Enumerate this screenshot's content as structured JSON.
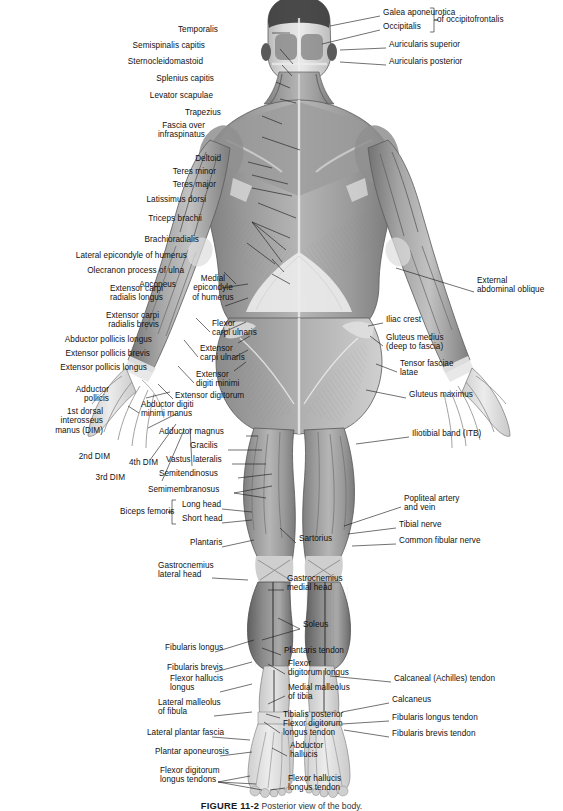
{
  "figure": {
    "caption_number": "FIGURE 11-2",
    "caption_text": "Posterior view of the body.",
    "view": "posterior",
    "background_color": "#ffffff",
    "ink_color": "#1a1a1a"
  },
  "labels_left": [
    {
      "id": "temporalis",
      "text": "Temporalis",
      "x": 218,
      "y": 30,
      "lines": 1
    },
    {
      "id": "semispinalis-capitis",
      "text": "Semispinalis capitis",
      "x": 205,
      "y": 46,
      "lines": 1
    },
    {
      "id": "sternocleidomastoid",
      "text": "Sternocleidomastoid",
      "x": 203,
      "y": 62,
      "lines": 1
    },
    {
      "id": "splenius-capitis",
      "text": "Splenius capitis",
      "x": 214,
      "y": 79,
      "lines": 1
    },
    {
      "id": "levator-scapulae",
      "text": "Levator scapulae",
      "x": 213,
      "y": 96,
      "lines": 1
    },
    {
      "id": "trapezius",
      "text": "Trapezius",
      "x": 221,
      "y": 113,
      "lines": 1
    },
    {
      "id": "fascia-over-infraspinatus",
      "text": "Fascia over\ninfraspinatus",
      "x": 205,
      "y": 130,
      "lines": 2
    },
    {
      "id": "deltoid",
      "text": "Deltoid",
      "x": 221,
      "y": 159,
      "lines": 1
    },
    {
      "id": "teres-minor",
      "text": "Teres minor",
      "x": 216,
      "y": 172,
      "lines": 1
    },
    {
      "id": "teres-major",
      "text": "Teres major",
      "x": 216,
      "y": 185,
      "lines": 1
    },
    {
      "id": "latissimus-dorsi",
      "text": "Latissimus dorsi",
      "x": 206,
      "y": 200,
      "lines": 1
    },
    {
      "id": "triceps-brachii",
      "text": "Triceps brachii",
      "x": 202,
      "y": 219,
      "lines": 1
    },
    {
      "id": "brachioradialis",
      "text": "Brachioradialis",
      "x": 199,
      "y": 240,
      "lines": 1
    },
    {
      "id": "lateral-epicondyle-humerus",
      "text": "Lateral epicondyle of humerus",
      "x": 187,
      "y": 256,
      "lines": 1
    },
    {
      "id": "olecranon-process-ulna",
      "text": "Olecranon process of ulna",
      "x": 184,
      "y": 271,
      "lines": 1
    },
    {
      "id": "anconeus",
      "text": "Anconeus",
      "x": 176,
      "y": 285,
      "lines": 1
    },
    {
      "id": "extensor-carpi-radialis-longus",
      "text": "Extensor carpi\nradialis longus",
      "x": 163,
      "y": 293,
      "lines": 2
    },
    {
      "id": "extensor-carpi-radialis-brevis",
      "text": "Extensor carpi\nradialis brevis",
      "x": 159,
      "y": 320,
      "lines": 2
    },
    {
      "id": "abductor-pollicis-longus",
      "text": "Abductor pollicis longus",
      "x": 152,
      "y": 340,
      "lines": 1
    },
    {
      "id": "extensor-pollicis-brevis",
      "text": "Extensor pollicis brevis",
      "x": 150,
      "y": 354,
      "lines": 1
    },
    {
      "id": "extensor-pollicis-longus",
      "text": "Extensor pollicis longus",
      "x": 147,
      "y": 368,
      "lines": 1
    },
    {
      "id": "adductor-pollicis",
      "text": "Adductor\npollicis",
      "x": 109,
      "y": 394,
      "lines": 2
    },
    {
      "id": "first-dorsal-interosseus",
      "text": "1st dorsal\ninterosseus\nmanus (DIM)",
      "x": 103,
      "y": 421,
      "lines": 3
    },
    {
      "id": "second-dim",
      "text": "2nd DIM",
      "x": 110,
      "y": 457,
      "lines": 1
    },
    {
      "id": "third-dim",
      "text": "3rd DIM",
      "x": 125,
      "y": 478,
      "lines": 1
    },
    {
      "id": "fourth-dim",
      "text": "4th DIM",
      "x": 158,
      "y": 463,
      "lines": 1
    }
  ],
  "labels_mid": [
    {
      "id": "medial-epicondyle-humerus",
      "text": "Medial\nepicondyle\nof humerus",
      "x": 213,
      "y": 288,
      "lines": 3,
      "align": "center"
    },
    {
      "id": "flexor-carpi-ulnaris",
      "text": "Flexor\ncarpi ulnaris",
      "x": 212,
      "y": 328,
      "lines": 2,
      "align": "left"
    },
    {
      "id": "extensor-carpi-ulnaris",
      "text": "Extensor\ncarpi ulnaris",
      "x": 200,
      "y": 353,
      "lines": 2,
      "align": "left"
    },
    {
      "id": "extensor-digiti-minimi",
      "text": "Extensor\ndigiti minimi",
      "x": 196,
      "y": 379,
      "lines": 2,
      "align": "left"
    },
    {
      "id": "extensor-digitorum",
      "text": "Extensor digitorum",
      "x": 175,
      "y": 396,
      "lines": 1,
      "align": "left"
    },
    {
      "id": "abductor-digiti-minimi-manus",
      "text": "Abductor digiti\nminimi manus",
      "x": 141,
      "y": 409,
      "lines": 2,
      "align": "left"
    },
    {
      "id": "adductor-magnus",
      "text": "Adductor magnus",
      "x": 159,
      "y": 432,
      "lines": 1,
      "align": "left"
    },
    {
      "id": "gracilis",
      "text": "Gracilis",
      "x": 190,
      "y": 446,
      "lines": 1,
      "align": "left"
    },
    {
      "id": "vastus-lateralis",
      "text": "Vastus lateralis",
      "x": 166,
      "y": 460,
      "lines": 1,
      "align": "left"
    },
    {
      "id": "semitendinosus",
      "text": "Semitendinosus",
      "x": 159,
      "y": 474,
      "lines": 1,
      "align": "left"
    },
    {
      "id": "semimembranosus",
      "text": "Semimembranosus",
      "x": 148,
      "y": 490,
      "lines": 1,
      "align": "left"
    },
    {
      "id": "biceps-femoris-group",
      "text": "Biceps femoris",
      "x": 120,
      "y": 512,
      "lines": 1,
      "align": "left"
    },
    {
      "id": "long-head",
      "text": "Long head",
      "x": 182,
      "y": 505,
      "lines": 1,
      "align": "left"
    },
    {
      "id": "short-head",
      "text": "Short head",
      "x": 182,
      "y": 519,
      "lines": 1,
      "align": "left"
    },
    {
      "id": "plantaris",
      "text": "Plantaris",
      "x": 190,
      "y": 543,
      "lines": 1,
      "align": "left"
    },
    {
      "id": "sartorius",
      "text": "Sartorius",
      "x": 299,
      "y": 539,
      "lines": 1,
      "align": "left"
    },
    {
      "id": "gastrocnemius-lateral-head",
      "text": "Gastrocnemius\nlateral head",
      "x": 158,
      "y": 570,
      "lines": 2,
      "align": "left"
    },
    {
      "id": "gastrocnemius-medial-head",
      "text": "Gastrocnemius\nmedial head",
      "x": 287,
      "y": 583,
      "lines": 2,
      "align": "left"
    },
    {
      "id": "soleus",
      "text": "Soleus",
      "x": 303,
      "y": 625,
      "lines": 1,
      "align": "left"
    },
    {
      "id": "fibularis-longus",
      "text": "Fibularis longus",
      "x": 165,
      "y": 648,
      "lines": 1,
      "align": "left"
    },
    {
      "id": "plantaris-tendon",
      "text": "Plantaris tendon",
      "x": 284,
      "y": 651,
      "lines": 1,
      "align": "left"
    },
    {
      "id": "fibularis-brevis",
      "text": "Fibularis brevis",
      "x": 167,
      "y": 668,
      "lines": 1,
      "align": "left"
    },
    {
      "id": "flexor-digitorum-longus",
      "text": "Flexor\ndigitorum longus",
      "x": 288,
      "y": 668,
      "lines": 2,
      "align": "left"
    },
    {
      "id": "flexor-hallucis-longus",
      "text": "Flexor hallucis\nlongus",
      "x": 170,
      "y": 683,
      "lines": 2,
      "align": "left"
    },
    {
      "id": "medial-malleolus-tibia",
      "text": "Medial malleolus\nof tibia",
      "x": 288,
      "y": 692,
      "lines": 2,
      "align": "left"
    },
    {
      "id": "lateral-malleolus-fibula",
      "text": "Lateral malleolus\nof fibula",
      "x": 158,
      "y": 707,
      "lines": 2,
      "align": "left"
    },
    {
      "id": "tibialis-posterior",
      "text": "Tibialis posterior",
      "x": 283,
      "y": 715,
      "lines": 1,
      "align": "left"
    },
    {
      "id": "flexor-digitorum-longus-tendon",
      "text": "Flexor digitorum\nlongus tendon",
      "x": 283,
      "y": 728,
      "lines": 2,
      "align": "left"
    },
    {
      "id": "lateral-plantar-fascia",
      "text": "Lateral plantar fascia",
      "x": 147,
      "y": 733,
      "lines": 1,
      "align": "left"
    },
    {
      "id": "plantar-aponeurosis",
      "text": "Plantar aponeurosis",
      "x": 155,
      "y": 752,
      "lines": 1,
      "align": "left"
    },
    {
      "id": "abductor-hallucis",
      "text": "Abductor\nhallucis",
      "x": 290,
      "y": 750,
      "lines": 2,
      "align": "left"
    },
    {
      "id": "flexor-digitorum-longus-tendons",
      "text": "Flexor digitorum\nlongus tendons",
      "x": 160,
      "y": 775,
      "lines": 2,
      "align": "left"
    },
    {
      "id": "flexor-hallucis-longus-tendon",
      "text": "Flexor hallucis\nlongus tendon",
      "x": 288,
      "y": 783,
      "lines": 2,
      "align": "left"
    }
  ],
  "labels_right": [
    {
      "id": "galea-aponeurotica",
      "text": "Galea aponeurotica",
      "x": 383,
      "y": 13,
      "lines": 1
    },
    {
      "id": "occipitalis",
      "text": "Occipitalis",
      "x": 383,
      "y": 27,
      "lines": 1
    },
    {
      "id": "of-occipitofrontalis",
      "text": "of occipitofrontalis",
      "x": 437,
      "y": 20,
      "lines": 1
    },
    {
      "id": "auricularis-superior",
      "text": "Auricularis superior",
      "x": 389,
      "y": 45,
      "lines": 1
    },
    {
      "id": "auricularis-posterior",
      "text": "Auricularis posterior",
      "x": 389,
      "y": 62,
      "lines": 1
    },
    {
      "id": "external-abdominal-oblique",
      "text": "External\nabdominal oblique",
      "x": 477,
      "y": 285,
      "lines": 2
    },
    {
      "id": "iliac-crest",
      "text": "Iliac crest",
      "x": 386,
      "y": 320,
      "lines": 1
    },
    {
      "id": "gluteus-medius",
      "text": "Gluteus medius\n(deep to fascia)",
      "x": 386,
      "y": 342,
      "lines": 2
    },
    {
      "id": "tensor-fasciae-latae",
      "text": "Tensor fasciae\nlatae",
      "x": 400,
      "y": 368,
      "lines": 2
    },
    {
      "id": "gluteus-maximus",
      "text": "Gluteus maximus",
      "x": 409,
      "y": 395,
      "lines": 1
    },
    {
      "id": "iliotibial-band",
      "text": "Iliotibial band (ITB)",
      "x": 412,
      "y": 434,
      "lines": 1
    },
    {
      "id": "popliteal-artery-vein",
      "text": "Popliteal artery\nand vein",
      "x": 404,
      "y": 503,
      "lines": 2
    },
    {
      "id": "tibial-nerve",
      "text": "Tibial nerve",
      "x": 399,
      "y": 525,
      "lines": 1
    },
    {
      "id": "common-fibular-nerve",
      "text": "Common fibular nerve",
      "x": 399,
      "y": 541,
      "lines": 1
    },
    {
      "id": "calcaneal-achilles-tendon",
      "text": "Calcaneal (Achilles) tendon",
      "x": 394,
      "y": 679,
      "lines": 1
    },
    {
      "id": "calcaneus",
      "text": "Calcaneus",
      "x": 392,
      "y": 700,
      "lines": 1
    },
    {
      "id": "fibularis-longus-tendon",
      "text": "Fibularis longus tendon",
      "x": 392,
      "y": 718,
      "lines": 1
    },
    {
      "id": "fibularis-brevis-tendon",
      "text": "Fibularis brevis tendon",
      "x": 392,
      "y": 734,
      "lines": 1
    }
  ]
}
